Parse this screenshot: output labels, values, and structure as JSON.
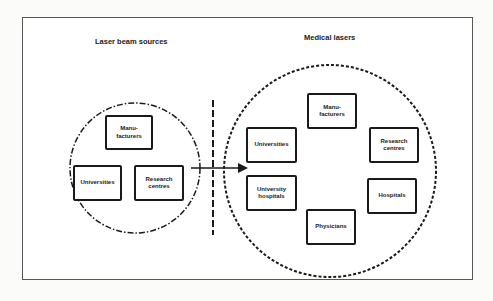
{
  "diagram": {
    "left_group": {
      "title": "Laser beam sources",
      "nodes": [
        {
          "id": "manufacturers",
          "label": "Manu-\nfacturers"
        },
        {
          "id": "universities",
          "label": "Universities"
        },
        {
          "id": "research-centres",
          "label": "Research\ncentres"
        }
      ]
    },
    "right_group": {
      "title": "Medical lasers",
      "nodes": [
        {
          "id": "manufacturers",
          "label": "Manu-\nfacturers"
        },
        {
          "id": "universities",
          "label": "Universities"
        },
        {
          "id": "research-centres",
          "label": "Research\ncentres"
        },
        {
          "id": "university-hospitals",
          "label": "University\nhospitals"
        },
        {
          "id": "hospitals",
          "label": "Hospitals"
        },
        {
          "id": "physicians",
          "label": "Physicians"
        }
      ]
    },
    "edges": [
      {
        "from": "left_group",
        "to": "right_group",
        "type": "arrow"
      }
    ],
    "separator": "dashed-vertical-line",
    "colors": {
      "stroke": "#1a1a1a",
      "frame": "#555555",
      "background": "#ffffff"
    }
  }
}
